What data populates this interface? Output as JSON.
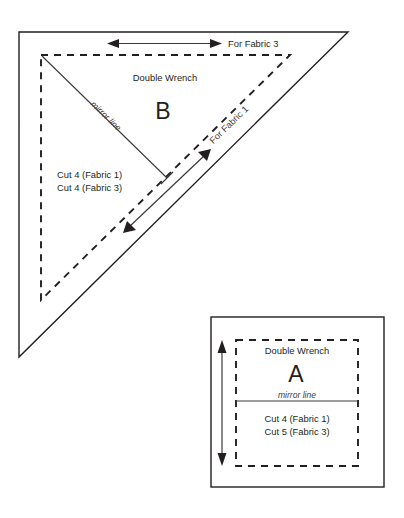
{
  "document": {
    "title": "Double Wrench quilt block cutting diagram",
    "background_color": "#ffffff",
    "ink_color": "#231f20"
  },
  "piece_b": {
    "shape": "right-triangle",
    "block_name": "Double Wrench",
    "piece_letter": "B",
    "mirror_line_label": "mirror line",
    "cut_lines": [
      "Cut 4 (Fabric 1)",
      "Cut 4 (Fabric 3)"
    ],
    "grain_arrows": [
      {
        "label": "For Fabric 3",
        "orientation": "horizontal"
      },
      {
        "label": "For Fabric 1",
        "orientation": "diagonal"
      }
    ]
  },
  "piece_a": {
    "shape": "square",
    "block_name": "Double Wrench",
    "piece_letter": "A",
    "mirror_line_label": "mirror line",
    "cut_lines": [
      "Cut 4 (Fabric 1)",
      "Cut 5 (Fabric 3)"
    ],
    "grain_arrow": {
      "label": "",
      "orientation": "vertical"
    }
  }
}
